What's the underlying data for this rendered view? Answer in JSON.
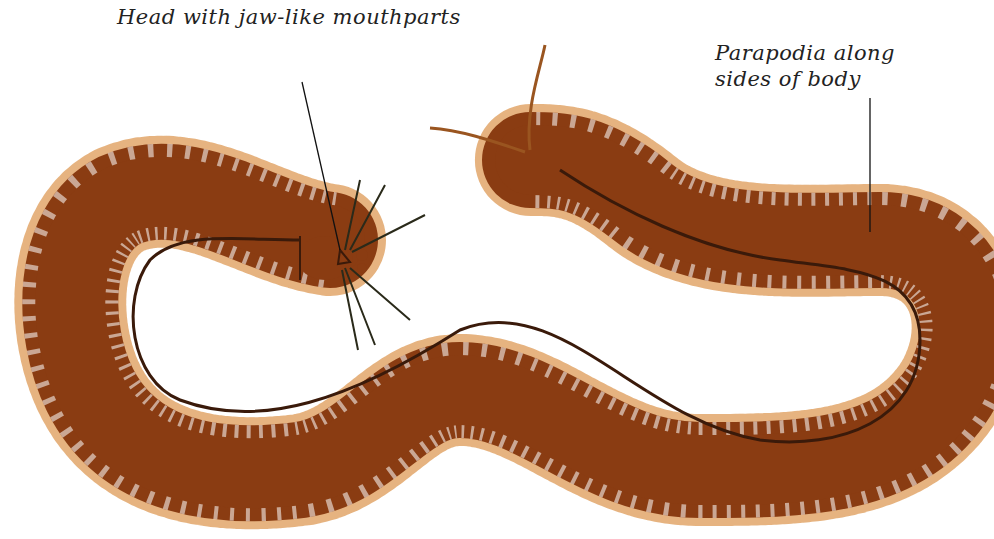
{
  "figure": {
    "labels": [
      {
        "id": "head",
        "text": "Head with jaw-like mouthparts"
      },
      {
        "id": "parapodia_line1",
        "text": "Parapodia along"
      },
      {
        "id": "parapodia_line2",
        "text": "sides of body"
      }
    ],
    "colors": {
      "body": "#8a3c12",
      "bristle": "#e0a060",
      "gut_line": "#3a1a0a",
      "leader_line": "#111111",
      "background": "#ffffff"
    }
  }
}
